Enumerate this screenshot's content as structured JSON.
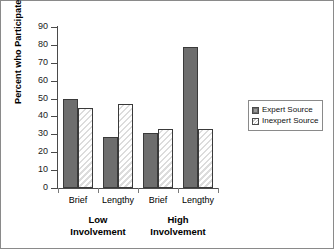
{
  "chart_data": {
    "type": "bar",
    "title": "",
    "xlabel": "",
    "ylabel": "Percent who Participated",
    "ylim": [
      0,
      90
    ],
    "ytick_step": 10,
    "grid": false,
    "legend_position": "right",
    "categories": [
      "Brief",
      "Lengthy",
      "Brief",
      "Lengthy"
    ],
    "group_labels": [
      "Low Involvement",
      "High Involvement"
    ],
    "series": [
      {
        "name": "Expert Source",
        "values": [
          50,
          28.5,
          30.5,
          79
        ]
      },
      {
        "name": "Inexpert Source",
        "values": [
          44.5,
          47,
          33,
          33
        ]
      }
    ]
  },
  "axis": {
    "y_ticks": [
      "0",
      "10",
      "20",
      "30",
      "40",
      "50",
      "60",
      "70",
      "80",
      "90"
    ],
    "y_title": "Percent who Participated"
  },
  "xaxis": {
    "cat_labels": [
      "Brief",
      "Lengthy",
      "Brief",
      "Lengthy"
    ],
    "group_low_line1": "Low",
    "group_low_line2": "Involvement",
    "group_high_line1": "High",
    "group_high_line2": "Involvement"
  },
  "legend": {
    "items": [
      {
        "label": "Expert Source",
        "key": "expert"
      },
      {
        "label": "Inexpert Source",
        "key": "inexpert"
      }
    ]
  },
  "colors": {
    "expert_fill": "#6e6e6e",
    "inexpert_hatch": "#dcdcdc",
    "bar_outline": "#3a3a3a",
    "axis": "#4a4a4a",
    "frame": "#8a8a8a"
  }
}
